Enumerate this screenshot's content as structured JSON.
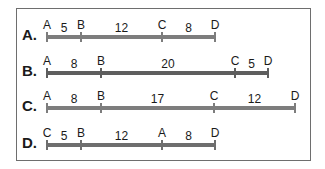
{
  "line_color_default": "#7d7d7d",
  "line_color_dark": "#5e5e5e",
  "rows": [
    {
      "label": "A.",
      "y": 37,
      "color": "#7d7d7d",
      "points": [
        {
          "name": "A",
          "x": 47
        },
        {
          "name": "B",
          "x": 81
        },
        {
          "name": "C",
          "x": 162
        },
        {
          "name": "D",
          "x": 215
        }
      ],
      "lengths": [
        "5",
        "12",
        "8"
      ]
    },
    {
      "label": "B.",
      "y": 73,
      "color": "#5e5e5e",
      "points": [
        {
          "name": "A",
          "x": 47
        },
        {
          "name": "B",
          "x": 101
        },
        {
          "name": "C",
          "x": 235
        },
        {
          "name": "D",
          "x": 268
        }
      ],
      "lengths": [
        "8",
        "20",
        "5"
      ]
    },
    {
      "label": "C.",
      "y": 108,
      "color": "#7d7d7d",
      "points": [
        {
          "name": "A",
          "x": 47
        },
        {
          "name": "B",
          "x": 101
        },
        {
          "name": "C",
          "x": 214
        },
        {
          "name": "D",
          "x": 295
        }
      ],
      "lengths": [
        "8",
        "17",
        "12"
      ]
    },
    {
      "label": "D.",
      "y": 145,
      "color": "#6e6e6e",
      "points": [
        {
          "name": "C",
          "x": 47
        },
        {
          "name": "B",
          "x": 81
        },
        {
          "name": "A",
          "x": 162
        },
        {
          "name": "D",
          "x": 215
        }
      ],
      "lengths": [
        "5",
        "12",
        "8"
      ]
    }
  ]
}
